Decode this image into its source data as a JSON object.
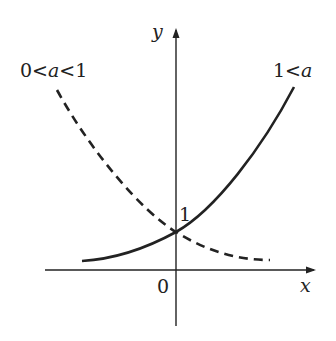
{
  "diagram": {
    "axes": {
      "x_label": "x",
      "y_label": "y",
      "origin_label": "0",
      "y_intercept_label": "1"
    },
    "curves": [
      {
        "name": "growth",
        "label": "1<a",
        "style": "solid"
      },
      {
        "name": "decay",
        "label": "0<a<1",
        "style": "dashed"
      }
    ],
    "labels": {
      "decay_left": "0<",
      "decay_a": "a",
      "decay_right": "<1",
      "growth_left": "1<",
      "growth_a": "a"
    }
  }
}
